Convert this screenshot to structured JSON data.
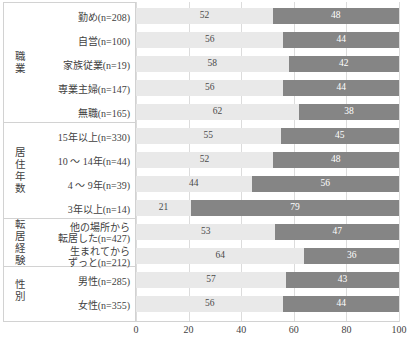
{
  "chart_data": {
    "type": "bar",
    "subtype": "stacked-horizontal-100",
    "title": "",
    "xlabel": "",
    "ylabel": "",
    "xlim": [
      0,
      100
    ],
    "xticks": [
      "0",
      "20",
      "40",
      "60",
      "80",
      "100"
    ],
    "grid": true,
    "legend": "none",
    "series": [
      {
        "name": "series-a",
        "color": "#e9e9e9",
        "values": [
          52,
          56,
          58,
          56,
          62,
          55,
          52,
          44,
          21,
          53,
          64,
          57,
          56
        ]
      },
      {
        "name": "series-b",
        "color": "#858585",
        "values": [
          48,
          44,
          42,
          44,
          38,
          45,
          48,
          56,
          79,
          47,
          36,
          43,
          44
        ]
      }
    ],
    "categories": [
      "勤め(n=208)",
      "自営(n=100)",
      "家族従業(n=19)",
      "専業主婦(n=147)",
      "無職(n=165)",
      "15年以上(n=330)",
      "10 ～ 14年(n=44)",
      "4 ～ 9年(n=39)",
      "3年以上(n=14)",
      "他の場所から\n転居した(n=427)",
      "生まれてから\nずっと(n=212)",
      "男性(n=285)",
      "女性(n=355)"
    ],
    "groups": [
      {
        "title": "職業",
        "rows": [
          {
            "label": "勤め(n=208)",
            "a": 52,
            "b": 48
          },
          {
            "label": "自営(n=100)",
            "a": 56,
            "b": 44
          },
          {
            "label": "家族従業(n=19)",
            "a": 58,
            "b": 42
          },
          {
            "label": "専業主婦(n=147)",
            "a": 56,
            "b": 44
          },
          {
            "label": "無職(n=165)",
            "a": 62,
            "b": 38
          }
        ]
      },
      {
        "title": "居住年数",
        "rows": [
          {
            "label": "15年以上(n=330)",
            "a": 55,
            "b": 45
          },
          {
            "label": "10 ～ 14年(n=44)",
            "a": 52,
            "b": 48
          },
          {
            "label": "4 ～ 9年(n=39)",
            "a": 44,
            "b": 56
          },
          {
            "label": "3年以上(n=14)",
            "a": 21,
            "b": 79
          }
        ]
      },
      {
        "title": "転居経験",
        "rows": [
          {
            "label": "他の場所から\n転居した(n=427)",
            "a": 53,
            "b": 47
          },
          {
            "label": "生まれてから\nずっと(n=212)",
            "a": 64,
            "b": 36
          }
        ]
      },
      {
        "title": "性別",
        "rows": [
          {
            "label": "男性(n=285)",
            "a": 57,
            "b": 43
          },
          {
            "label": "女性(n=355)",
            "a": 56,
            "b": 44
          }
        ]
      }
    ]
  }
}
